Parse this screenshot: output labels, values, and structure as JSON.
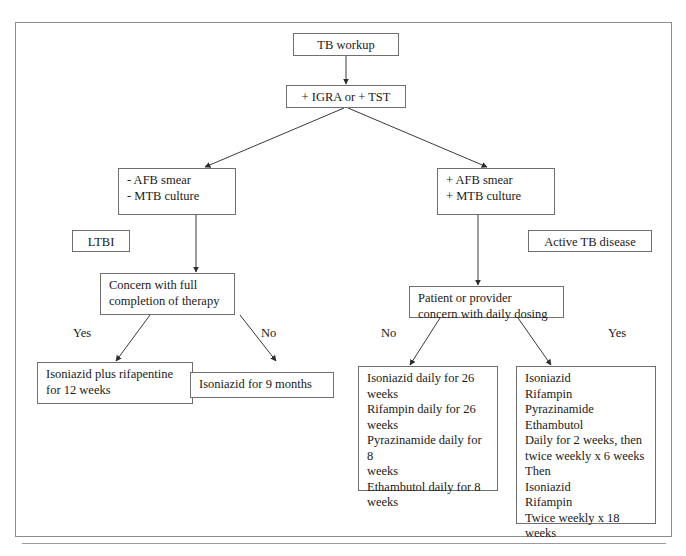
{
  "diagram": {
    "nodes": {
      "tb_workup": "TB workup",
      "igra_tst": "+ IGRA or + TST",
      "neg_smear_culture": "- AFB smear\n- MTB culture",
      "pos_smear_culture": "+ AFB smear\n+ MTB culture",
      "ltbi": "LTBI",
      "active_tb": "Active TB disease",
      "concern_completion": "Concern with full\ncompletion of therapy",
      "concern_daily_dosing": "Patient or provider\nconcern with daily dosing",
      "inh_rpt_12wk": "Isoniazid plus rifapentine\nfor 12 weeks",
      "inh_9_months": "Isoniazid for 9 months",
      "daily_regimen": "Isoniazid daily for 26 weeks\nRifampin daily for 26\nweeks\nPyrazinamide daily for 8\nweeks\nEthambutol daily for 8\nweeks",
      "intermittent_regimen": "Isoniazid\nRifampin\nPyrazinamide\nEthambutol\nDaily for 2 weeks, then\ntwice weekly x 6 weeks\nThen\nIsoniazid\nRifampin\nTwice weekly x 18 weeks"
    },
    "edge_labels": {
      "ltbi_yes": "Yes",
      "ltbi_no": "No",
      "active_no": "No",
      "active_yes": "Yes"
    },
    "colors": {
      "border": "#6f6f6f",
      "frame": "#8c8c8c",
      "line": "#3a3a3a",
      "text": "#1a1a1a",
      "background": "#ffffff"
    }
  }
}
